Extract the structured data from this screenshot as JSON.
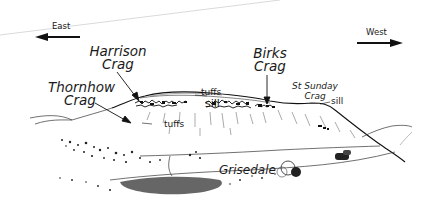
{
  "figure": {
    "type": "landscape-sketch",
    "background": "#ffffff",
    "ink": "#1a1a1a"
  },
  "directions": {
    "left": {
      "label": "East",
      "arrow": "left"
    },
    "right": {
      "label": "West",
      "arrow": "right"
    }
  },
  "peaks": [
    {
      "name_line1": "Harrison",
      "name_line2": "Crag"
    },
    {
      "name_line1": "Thornhow",
      "name_line2": "Crag"
    },
    {
      "name_line1": "Birks",
      "name_line2": "Crag"
    },
    {
      "name_line1": "St Sunday",
      "name_line2": "Crag"
    }
  ],
  "rock_labels": {
    "tuffs_upper": "tuffs",
    "sill_main": "sill",
    "tuffs_lower": "tuffs",
    "sill_right": "sill"
  },
  "valley": {
    "label": "Grisedale"
  }
}
